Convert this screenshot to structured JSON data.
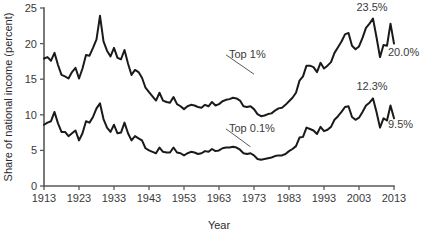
{
  "chart_data": {
    "type": "line",
    "title": "",
    "xlabel": "Year",
    "ylabel": "Share of national income (percent)",
    "xlim": [
      1913,
      2013
    ],
    "ylim": [
      0,
      25
    ],
    "grid": false,
    "legend_position": "inline-annotation",
    "xticks": [
      1913,
      1923,
      1933,
      1943,
      1953,
      1963,
      1973,
      1983,
      1993,
      2003,
      2013
    ],
    "xtick_labels": [
      "1913",
      "1923",
      "1933",
      "1943",
      "1953",
      "1963",
      "1973",
      "1983",
      "1993",
      "2003",
      "2013"
    ],
    "yticks": [
      0,
      5,
      10,
      15,
      20,
      25
    ],
    "ytick_labels": [
      "0",
      "5",
      "10",
      "15",
      "20",
      "25"
    ],
    "annotations": [
      {
        "name": "top1-peak",
        "text": "23.5%",
        "x": 2007,
        "y": 23.5
      },
      {
        "name": "top1-end",
        "text": "20.0%",
        "x": 2013,
        "y": 20.0
      },
      {
        "name": "top01-peak",
        "text": "12.3%",
        "x": 2007,
        "y": 12.3
      },
      {
        "name": "top01-end",
        "text": "9.5%",
        "x": 2013,
        "y": 9.5
      },
      {
        "name": "top1-series-label",
        "text": "Top 1%",
        "x": 1963,
        "y": 18.0
      },
      {
        "name": "top01-series-label",
        "text": "Top 0.1%",
        "x": 1963,
        "y": 7.6
      }
    ],
    "series": [
      {
        "name": "Top 1%",
        "label": "Top 1%",
        "color": "#1a1a1a",
        "x": [
          1913,
          1914,
          1915,
          1916,
          1917,
          1918,
          1919,
          1920,
          1921,
          1922,
          1923,
          1924,
          1925,
          1926,
          1927,
          1928,
          1929,
          1930,
          1931,
          1932,
          1933,
          1934,
          1935,
          1936,
          1937,
          1938,
          1939,
          1940,
          1941,
          1942,
          1943,
          1944,
          1945,
          1946,
          1947,
          1948,
          1949,
          1950,
          1951,
          1952,
          1953,
          1954,
          1955,
          1956,
          1957,
          1958,
          1959,
          1960,
          1961,
          1962,
          1963,
          1964,
          1965,
          1966,
          1967,
          1968,
          1969,
          1970,
          1971,
          1972,
          1973,
          1974,
          1975,
          1976,
          1977,
          1978,
          1979,
          1980,
          1981,
          1982,
          1983,
          1984,
          1985,
          1986,
          1987,
          1988,
          1989,
          1990,
          1991,
          1992,
          1993,
          1994,
          1995,
          1996,
          1997,
          1998,
          1999,
          2000,
          2001,
          2002,
          2003,
          2004,
          2005,
          2006,
          2007,
          2008,
          2009,
          2010,
          2011,
          2012,
          2013
        ],
        "values": [
          17.9,
          18.1,
          17.6,
          18.7,
          17.0,
          15.6,
          15.4,
          15.1,
          16.0,
          16.6,
          15.1,
          16.5,
          18.4,
          18.3,
          19.4,
          20.6,
          23.9,
          20.3,
          19.0,
          18.2,
          19.4,
          18.0,
          17.8,
          19.1,
          17.2,
          15.6,
          16.3,
          16.0,
          15.2,
          13.8,
          13.2,
          12.6,
          12.0,
          13.1,
          12.0,
          11.8,
          11.7,
          12.5,
          11.5,
          11.2,
          10.8,
          11.2,
          11.4,
          11.3,
          11.1,
          11.0,
          11.4,
          11.2,
          11.8,
          11.3,
          11.5,
          11.9,
          12.1,
          12.2,
          12.4,
          12.3,
          12.0,
          11.2,
          11.1,
          11.2,
          10.8,
          10.1,
          9.8,
          9.9,
          10.1,
          10.2,
          10.6,
          10.9,
          11.0,
          11.4,
          11.9,
          12.4,
          13.1,
          14.8,
          15.4,
          16.9,
          16.9,
          16.7,
          16.0,
          17.3,
          16.5,
          16.9,
          17.4,
          18.7,
          19.5,
          20.3,
          21.3,
          21.5,
          19.7,
          19.2,
          19.6,
          20.8,
          22.2,
          22.8,
          23.5,
          20.9,
          18.1,
          19.8,
          19.7,
          22.8,
          20.0
        ]
      },
      {
        "name": "Top 0.1%",
        "label": "Top 0.1%",
        "color": "#1a1a1a",
        "x": [
          1913,
          1914,
          1915,
          1916,
          1917,
          1918,
          1919,
          1920,
          1921,
          1922,
          1923,
          1924,
          1925,
          1926,
          1927,
          1928,
          1929,
          1930,
          1931,
          1932,
          1933,
          1934,
          1935,
          1936,
          1937,
          1938,
          1939,
          1940,
          1941,
          1942,
          1943,
          1944,
          1945,
          1946,
          1947,
          1948,
          1949,
          1950,
          1951,
          1952,
          1953,
          1954,
          1955,
          1956,
          1957,
          1958,
          1959,
          1960,
          1961,
          1962,
          1963,
          1964,
          1965,
          1966,
          1967,
          1968,
          1969,
          1970,
          1971,
          1972,
          1973,
          1974,
          1975,
          1976,
          1977,
          1978,
          1979,
          1980,
          1981,
          1982,
          1983,
          1984,
          1985,
          1986,
          1987,
          1988,
          1989,
          1990,
          1991,
          1992,
          1993,
          1994,
          1995,
          1996,
          1997,
          1998,
          1999,
          2000,
          2001,
          2002,
          2003,
          2004,
          2005,
          2006,
          2007,
          2008,
          2009,
          2010,
          2011,
          2012,
          2013
        ],
        "values": [
          8.6,
          8.9,
          9.1,
          10.4,
          8.8,
          7.6,
          7.6,
          7.0,
          7.4,
          7.8,
          6.4,
          7.4,
          9.1,
          8.9,
          9.7,
          10.9,
          11.6,
          9.4,
          8.2,
          7.6,
          8.6,
          7.4,
          7.5,
          8.9,
          7.4,
          6.4,
          7.0,
          6.7,
          6.4,
          5.3,
          5.0,
          4.8,
          4.6,
          5.4,
          4.8,
          4.7,
          4.7,
          5.4,
          4.7,
          4.6,
          4.3,
          4.6,
          4.8,
          4.7,
          4.5,
          4.6,
          4.9,
          4.8,
          5.2,
          4.9,
          5.0,
          5.3,
          5.4,
          5.4,
          5.5,
          5.4,
          5.1,
          4.6,
          4.5,
          4.6,
          4.3,
          3.8,
          3.7,
          3.8,
          3.9,
          4.0,
          4.2,
          4.3,
          4.3,
          4.5,
          4.9,
          5.2,
          5.6,
          6.8,
          6.9,
          8.2,
          8.0,
          7.8,
          7.3,
          8.3,
          7.7,
          7.9,
          8.3,
          9.3,
          9.8,
          10.4,
          11.1,
          11.2,
          9.7,
          9.3,
          9.6,
          10.4,
          11.3,
          11.7,
          12.3,
          10.4,
          8.2,
          9.5,
          9.2,
          11.3,
          9.5
        ]
      }
    ]
  },
  "figure": {
    "background_color": "#ffffff",
    "line_color": "#1a1a1a",
    "axis_color": "#58595b",
    "text_color": "#3a3a3a"
  }
}
